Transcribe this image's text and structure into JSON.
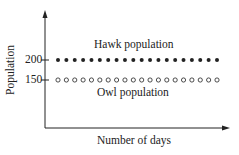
{
  "chart_data": {
    "type": "scatter",
    "title": "",
    "xlabel": "Number of days",
    "ylabel": "Population",
    "yticks": [
      150,
      200
    ],
    "xticks": [],
    "grid": false,
    "legend": "inline annotations",
    "series": [
      {
        "name": "Hawk population",
        "marker": "filled-circle",
        "values": [
          200,
          200,
          200,
          200,
          200,
          200,
          200,
          200,
          200,
          200,
          200,
          200,
          200,
          200,
          200,
          200,
          200,
          200,
          200,
          200
        ]
      },
      {
        "name": "Owl population",
        "marker": "open-circle",
        "values": [
          150,
          150,
          150,
          150,
          150,
          150,
          150,
          150,
          150,
          150,
          150,
          150,
          150,
          150,
          150,
          150,
          150,
          150,
          150,
          150
        ]
      }
    ],
    "x": [
      1,
      2,
      3,
      4,
      5,
      6,
      7,
      8,
      9,
      10,
      11,
      12,
      13,
      14,
      15,
      16,
      17,
      18,
      19,
      20
    ],
    "annotations": [
      "Hawk population",
      "Owl population"
    ]
  },
  "labels": {
    "hawk": "Hawk population",
    "owl": "Owl population",
    "xlabel": "Number of days",
    "ylabel": "Population",
    "tick200": "200",
    "tick150": "150"
  },
  "colors": {
    "ink": "#222222",
    "background": "#ffffff"
  }
}
